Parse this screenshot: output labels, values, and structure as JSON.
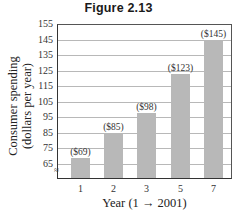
{
  "figure": {
    "title": "Figure 2.13"
  },
  "chart_data": {
    "type": "bar",
    "title": "Figure 2.13",
    "xlabel": "Year (1 → 2001)",
    "ylabel_line1": "Consumer spending",
    "ylabel_line2": "(dollars per year)",
    "categories": [
      "1",
      "2",
      "3",
      "5",
      "7"
    ],
    "values": [
      69,
      85,
      98,
      123,
      145
    ],
    "value_labels": [
      "($69)",
      "($85)",
      "($98)",
      "($123)",
      "($145)"
    ],
    "yticks": [
      "155",
      "145",
      "135",
      "125",
      "115",
      "105",
      "95",
      "85",
      "75",
      "65"
    ],
    "ylim": [
      58,
      155
    ],
    "y_axis_break": true,
    "grid": true,
    "legend": null,
    "bar_color": "#b8b8b8"
  }
}
